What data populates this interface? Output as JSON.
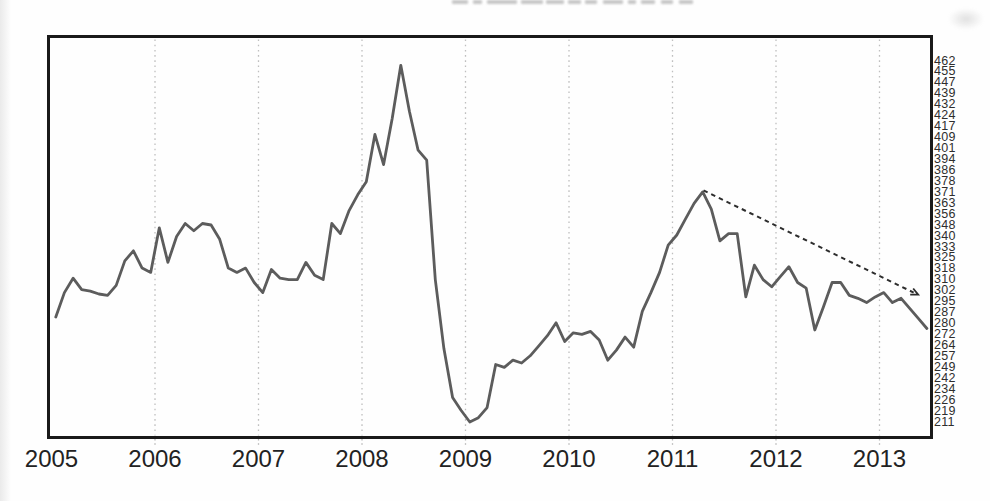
{
  "chart_data": {
    "type": "line",
    "x_axis": {
      "tick_labels": [
        "2005",
        "2006",
        "2007",
        "2008",
        "2009",
        "2010",
        "2011",
        "2012",
        "2013"
      ],
      "gridline_years": [
        2006,
        2007,
        2008,
        2009,
        2010,
        2011,
        2012,
        2013
      ],
      "gridline_style": "dotted",
      "range_years": [
        2005,
        2013.5
      ]
    },
    "y_axis": {
      "side": "right",
      "top_value": 462,
      "bottom_value": 211,
      "tick_labels": [
        "462",
        "455",
        "447",
        "439",
        "432",
        "424",
        "417",
        "409",
        "401",
        "394",
        "386",
        "378",
        "371",
        "363",
        "356",
        "348",
        "340",
        "333",
        "325",
        "318",
        "310",
        "302",
        "295",
        "287",
        "280",
        "272",
        "264",
        "257",
        "249",
        "242",
        "234",
        "226",
        "219",
        "211"
      ]
    },
    "series": [
      {
        "name": "monthly-value-line",
        "frequency": "monthly",
        "start_year": 2005,
        "start_month": 1,
        "values": [
          284,
          301,
          311,
          303,
          302,
          300,
          299,
          306,
          323,
          330,
          318,
          315,
          346,
          322,
          340,
          349,
          344,
          349,
          348,
          338,
          318,
          315,
          318,
          308,
          301,
          317,
          311,
          310,
          310,
          322,
          313,
          310,
          349,
          342,
          358,
          369,
          378,
          411,
          390,
          422,
          459,
          427,
          400,
          393,
          310,
          262,
          228,
          219,
          211,
          214,
          221,
          251,
          249,
          254,
          252,
          257,
          264,
          271,
          280,
          267,
          273,
          272,
          274,
          268,
          254,
          261,
          270,
          263,
          288,
          301,
          315,
          334,
          341,
          352,
          363,
          371,
          359,
          337,
          342,
          342,
          298,
          320,
          310,
          305,
          312,
          319,
          308,
          304,
          275,
          291,
          308,
          308,
          299,
          297,
          294,
          298,
          301,
          294,
          297,
          290,
          283,
          276
        ]
      }
    ],
    "annotations": [
      {
        "type": "trend-arrow",
        "style": "dashed",
        "from": {
          "year": 2011.3,
          "value": 372
        },
        "to": {
          "year": 2013.33,
          "value": 301
        }
      }
    ],
    "legend": "none",
    "grid_horizontal": "off"
  },
  "colors": {
    "line": "#5c5c5c",
    "border": "#1a1a1a",
    "gridline": "#bfbfbf",
    "tick": "#b5b5b5",
    "arrow": "#2d2d2d",
    "y_label": "#2e2e2e",
    "x_label": "#222222",
    "background": "#fefefe"
  },
  "artifacts": {
    "cropped_title_blobs": [
      [
        452,
        16
      ],
      [
        473,
        9
      ],
      [
        487,
        30
      ],
      [
        521,
        22
      ],
      [
        546,
        18
      ],
      [
        568,
        13
      ],
      [
        585,
        12
      ],
      [
        603,
        20
      ],
      [
        628,
        8
      ],
      [
        641,
        14
      ],
      [
        661,
        12
      ],
      [
        679,
        14
      ]
    ]
  }
}
